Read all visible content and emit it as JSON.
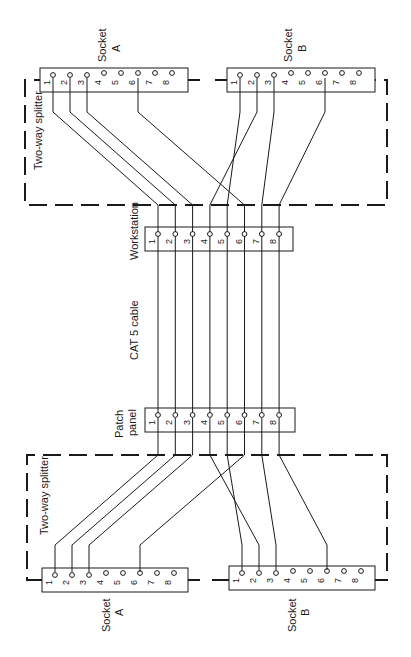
{
  "diagram": {
    "orientation": "rotated-90-ccw",
    "colors": {
      "ink": "#1a1a1a",
      "background": "#ffffff"
    },
    "center": {
      "workstation": {
        "label": "Workstation",
        "pins": [
          "1",
          "2",
          "3",
          "4",
          "5",
          "6",
          "7",
          "8"
        ]
      },
      "patch_panel": {
        "label_line1": "Patch",
        "label_line2": "panel",
        "pins": [
          "1",
          "2",
          "3",
          "4",
          "5",
          "6",
          "7",
          "8"
        ]
      },
      "cable_label": "CAT 5 cable"
    },
    "top_splitter": {
      "label": "Two-way splitter",
      "socket_a": {
        "label_line1": "Socket",
        "label_line2": "A",
        "pins": [
          "1",
          "2",
          "3",
          "4",
          "5",
          "6",
          "7",
          "8"
        ]
      },
      "socket_b": {
        "label_line1": "Socket",
        "label_line2": "B",
        "pins": [
          "1",
          "2",
          "3",
          "4",
          "5",
          "6",
          "7",
          "8"
        ]
      }
    },
    "bottom_splitter": {
      "label": "Two-way splitter",
      "socket_a": {
        "label_line1": "Socket",
        "label_line2": "A",
        "pins": [
          "1",
          "2",
          "3",
          "4",
          "5",
          "6",
          "7",
          "8"
        ]
      },
      "socket_b": {
        "label_line1": "Socket",
        "label_line2": "B",
        "pins": [
          "1",
          "2",
          "3",
          "4",
          "5",
          "6",
          "7",
          "8"
        ]
      }
    },
    "connections": {
      "workstation_to_top_splitter": [
        {
          "from": "W1",
          "to": "A1"
        },
        {
          "from": "W2",
          "to": "A2"
        },
        {
          "from": "W3",
          "to": "A3"
        },
        {
          "from": "W6",
          "to": "A6"
        },
        {
          "from": "W4",
          "to": "B2"
        },
        {
          "from": "W5",
          "to": "B1"
        },
        {
          "from": "W7",
          "to": "B3"
        },
        {
          "from": "W8",
          "to": "B6"
        }
      ],
      "patch_panel_to_bottom_splitter": [
        {
          "from": "P1",
          "to": "A1"
        },
        {
          "from": "P2",
          "to": "A2"
        },
        {
          "from": "P3",
          "to": "A3"
        },
        {
          "from": "P6",
          "to": "A6"
        },
        {
          "from": "P4",
          "to": "B2"
        },
        {
          "from": "P5",
          "to": "B1"
        },
        {
          "from": "P7",
          "to": "B3"
        },
        {
          "from": "P8",
          "to": "B6"
        }
      ],
      "cable": "straight-through 1-1 ... 8-8"
    }
  }
}
